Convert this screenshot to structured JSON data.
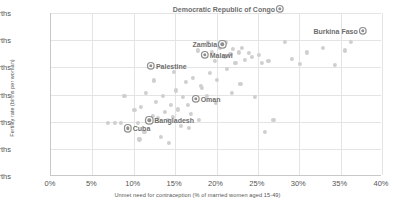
{
  "chart_data": {
    "type": "scatter",
    "title": "",
    "xlabel": "Unmet need for contraception (% of married women aged 15-49)",
    "ylabel": "Fertility rate (births per woman)",
    "xlim": [
      0,
      40
    ],
    "ylim": [
      0,
      6
    ],
    "grid": true,
    "legend": "none",
    "xticks": [
      "0%",
      "5%",
      "10%",
      "15%",
      "20%",
      "25%",
      "30%",
      "35%",
      "40%"
    ],
    "xtick_values": [
      0,
      5,
      10,
      15,
      20,
      25,
      30,
      35,
      40
    ],
    "yticks": [
      "0 births",
      "1 births",
      "2 births",
      "3 births",
      "4 births",
      "5 births",
      "6 births"
    ],
    "ytick_values": [
      0,
      1,
      2,
      3,
      4,
      5,
      6
    ],
    "labeled_points": [
      {
        "name": "Democratic Republic of Congo",
        "x": 27.8,
        "y": 6.15,
        "label_side": "left"
      },
      {
        "name": "Burkina Faso",
        "x": 37.8,
        "y": 5.35,
        "label_side": "left"
      },
      {
        "name": "Zambia",
        "x": 20.8,
        "y": 4.85,
        "label_side": "left"
      },
      {
        "name": "Malawi",
        "x": 18.7,
        "y": 4.45,
        "label_side": "right"
      },
      {
        "name": "Palestine",
        "x": 12.2,
        "y": 4.05,
        "label_side": "right"
      },
      {
        "name": "Oman",
        "x": 17.6,
        "y": 2.85,
        "label_side": "right"
      },
      {
        "name": "Bangladesh",
        "x": 12.0,
        "y": 2.05,
        "label_side": "right"
      },
      {
        "name": "Cuba",
        "x": 9.4,
        "y": 1.75,
        "label_side": "right"
      }
    ],
    "points": [
      {
        "x": 7.0,
        "y": 1.95
      },
      {
        "x": 7.8,
        "y": 1.95
      },
      {
        "x": 8.6,
        "y": 1.95
      },
      {
        "x": 9.4,
        "y": 1.75
      },
      {
        "x": 10.2,
        "y": 2.42
      },
      {
        "x": 10.6,
        "y": 1.95
      },
      {
        "x": 11.0,
        "y": 2.55
      },
      {
        "x": 11.4,
        "y": 1.62
      },
      {
        "x": 11.6,
        "y": 3.05
      },
      {
        "x": 12.0,
        "y": 2.05
      },
      {
        "x": 12.2,
        "y": 4.05
      },
      {
        "x": 12.4,
        "y": 2.22
      },
      {
        "x": 12.8,
        "y": 2.72
      },
      {
        "x": 13.0,
        "y": 2.15
      },
      {
        "x": 13.4,
        "y": 1.45
      },
      {
        "x": 13.6,
        "y": 2.95
      },
      {
        "x": 13.9,
        "y": 2.35
      },
      {
        "x": 14.2,
        "y": 2.05
      },
      {
        "x": 14.6,
        "y": 2.62
      },
      {
        "x": 14.9,
        "y": 2.18
      },
      {
        "x": 15.2,
        "y": 3.15
      },
      {
        "x": 15.5,
        "y": 2.45
      },
      {
        "x": 15.8,
        "y": 1.85
      },
      {
        "x": 16.1,
        "y": 2.92
      },
      {
        "x": 16.4,
        "y": 3.45
      },
      {
        "x": 16.7,
        "y": 2.62
      },
      {
        "x": 17.0,
        "y": 2.28
      },
      {
        "x": 17.3,
        "y": 3.62
      },
      {
        "x": 17.6,
        "y": 2.85
      },
      {
        "x": 17.9,
        "y": 4.62
      },
      {
        "x": 18.2,
        "y": 3.32
      },
      {
        "x": 18.4,
        "y": 3.25
      },
      {
        "x": 18.7,
        "y": 4.45
      },
      {
        "x": 19.0,
        "y": 2.95
      },
      {
        "x": 19.3,
        "y": 3.78
      },
      {
        "x": 19.6,
        "y": 4.58
      },
      {
        "x": 19.9,
        "y": 4.25
      },
      {
        "x": 20.2,
        "y": 3.55
      },
      {
        "x": 20.5,
        "y": 4.72
      },
      {
        "x": 20.8,
        "y": 4.85
      },
      {
        "x": 21.1,
        "y": 4.38
      },
      {
        "x": 21.4,
        "y": 3.95
      },
      {
        "x": 21.8,
        "y": 4.48
      },
      {
        "x": 22.1,
        "y": 4.68
      },
      {
        "x": 22.4,
        "y": 4.15
      },
      {
        "x": 22.8,
        "y": 4.55
      },
      {
        "x": 23.2,
        "y": 4.72
      },
      {
        "x": 23.6,
        "y": 4.28
      },
      {
        "x": 24.0,
        "y": 4.52
      },
      {
        "x": 24.4,
        "y": 4.38
      },
      {
        "x": 24.8,
        "y": 2.92
      },
      {
        "x": 25.2,
        "y": 4.45
      },
      {
        "x": 25.6,
        "y": 4.15
      },
      {
        "x": 26.0,
        "y": 1.62
      },
      {
        "x": 26.4,
        "y": 4.25
      },
      {
        "x": 27.0,
        "y": 2.05
      },
      {
        "x": 27.8,
        "y": 6.15
      },
      {
        "x": 28.4,
        "y": 4.95
      },
      {
        "x": 29.2,
        "y": 4.32
      },
      {
        "x": 30.2,
        "y": 4.12
      },
      {
        "x": 31.0,
        "y": 4.55
      },
      {
        "x": 33.0,
        "y": 4.72
      },
      {
        "x": 34.4,
        "y": 4.08
      },
      {
        "x": 35.6,
        "y": 4.62
      },
      {
        "x": 36.4,
        "y": 4.95
      },
      {
        "x": 37.8,
        "y": 5.35
      },
      {
        "x": 9.0,
        "y": 2.95
      },
      {
        "x": 10.8,
        "y": 1.35
      },
      {
        "x": 14.4,
        "y": 1.22
      },
      {
        "x": 16.8,
        "y": 1.78
      },
      {
        "x": 12.6,
        "y": 3.52
      },
      {
        "x": 15.0,
        "y": 3.82
      },
      {
        "x": 18.0,
        "y": 2.05
      },
      {
        "x": 20.0,
        "y": 2.68
      },
      {
        "x": 23.0,
        "y": 3.38
      },
      {
        "x": 21.2,
        "y": 4.92
      },
      {
        "x": 19.1,
        "y": 4.95
      },
      {
        "x": 22.0,
        "y": 3.05
      }
    ]
  }
}
